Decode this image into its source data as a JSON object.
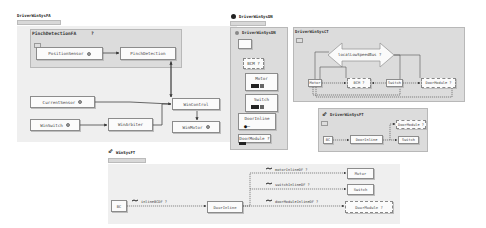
{
  "panels": {
    "fa": {
      "title": "DriverWinSysFA",
      "group": {
        "title": "PinchDetectionFA",
        "marker": "?"
      },
      "nodes": {
        "position_sensor": "PositionSensor",
        "pinch_detection": "PinchDetection",
        "current_sensor": "CurrentSensor",
        "win_switch": "WinSwitch",
        "win_arbiter": "WinArbiter",
        "win_control": "WinControl",
        "win_motor": "WinMotor"
      }
    },
    "dn": {
      "title": "DriverWinSysDN",
      "library": {
        "title": "DriverWinSysDN",
        "items": [
          "BCM ?",
          "Motor",
          "Switch",
          "DoorInline",
          "DoorModule ?"
        ]
      },
      "ct": {
        "title": "DriverWinSysCT",
        "bus": "localLowSpeedBus ?",
        "nodes": {
          "motor": "Motor",
          "bcm": "BCM ?",
          "switch": "Switch",
          "door_module": "DoorModule ?"
        }
      },
      "ft": {
        "title": "DriverWinSysFT",
        "nodes": {
          "bc": "BC",
          "door_inline": "DoorInline",
          "door_module": "DoorModule ?",
          "switch": "Switch"
        }
      }
    },
    "wh": {
      "title": "WinSysFT",
      "nodes": {
        "bc": "BC",
        "door_inline": "DoorInline",
        "motor": "Motor",
        "switch": "Switch",
        "door_module": "DoorModule ?"
      },
      "links": {
        "inline": "inlineBCDF ?",
        "motor": "motorInlineDF ?",
        "switch": "switchInlineDF ?",
        "door_module": "doorModuleInlineDF ?"
      }
    }
  }
}
